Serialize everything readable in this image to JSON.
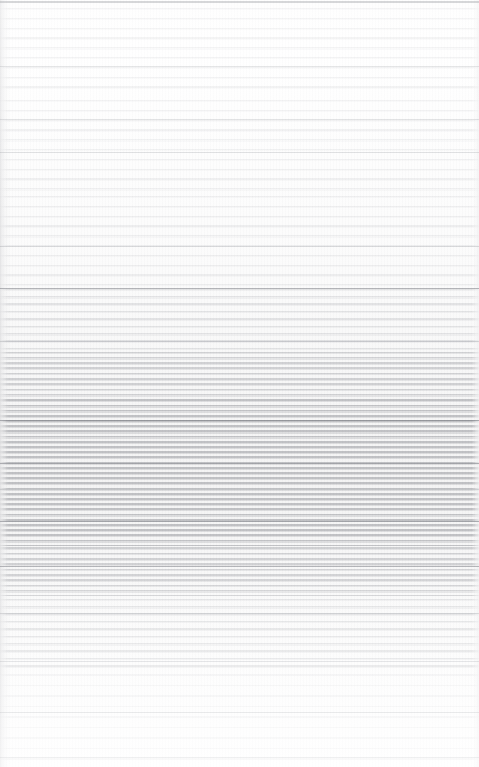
{
  "document": {
    "kind": "scanned-page",
    "legible_text": "",
    "note": "No legible text, headings, icons or UI chrome are resolvable in this scan; the page reads as extremely low-contrast horizontal line texture only.",
    "page_width_px": 479,
    "page_height_px": 767,
    "paper_color": "#fdfdfd",
    "ink_color": "#70727a"
  },
  "structure": {
    "top_rule": {
      "label": "top-edge-rule",
      "y": 1,
      "height": 2,
      "color": "#787a80"
    },
    "bands": [
      {
        "label": "upper-sparse-text",
        "density": "sparse",
        "top": 4,
        "height": 92,
        "line_pitch_px": 9.8
      },
      {
        "label": "upper-mid-sparse-text",
        "density": "sparse",
        "top": 96,
        "height": 96,
        "line_pitch_px": 9.8
      },
      {
        "label": "mid-upper-text",
        "density": "sparse",
        "top": 192,
        "height": 94,
        "line_pitch_px": 9.8
      },
      {
        "label": "transition-text",
        "density": "medium",
        "top": 286,
        "height": 64,
        "line_pitch_px": 7.4
      },
      {
        "label": "dense-text-upper",
        "density": "dense",
        "top": 350,
        "height": 48,
        "line_pitch_px": 5.3
      },
      {
        "label": "dense-text-core",
        "density": "densest",
        "top": 398,
        "height": 148,
        "line_pitch_px": 5.2
      },
      {
        "label": "dense-text-lower",
        "density": "dense",
        "top": 546,
        "height": 50,
        "line_pitch_px": 5.3
      },
      {
        "label": "lower-medium-text",
        "density": "medium",
        "top": 596,
        "height": 74,
        "line_pitch_px": 7.4
      },
      {
        "label": "foot-faint-text",
        "density": "faint",
        "top": 670,
        "height": 97,
        "line_pitch_px": 10.5
      }
    ],
    "accent_strokes": [
      {
        "label": "rule-upper-a",
        "y": 66,
        "weight": "soft"
      },
      {
        "label": "rule-upper-b",
        "y": 119,
        "weight": "soft"
      },
      {
        "label": "rule-upper-c",
        "y": 152,
        "weight": "soft"
      },
      {
        "label": "rule-mid-a",
        "y": 246,
        "weight": "soft"
      },
      {
        "label": "rule-mid-b",
        "y": 288,
        "weight": "hard"
      },
      {
        "label": "rule-mid-c",
        "y": 341,
        "weight": "soft"
      },
      {
        "label": "rule-core-a",
        "y": 420,
        "weight": "hard"
      },
      {
        "label": "rule-core-b",
        "y": 463,
        "weight": "hard"
      },
      {
        "label": "rule-core-c",
        "y": 489,
        "weight": "soft"
      },
      {
        "label": "rule-core-d",
        "y": 521,
        "weight": "hard"
      },
      {
        "label": "rule-lower-a",
        "y": 566,
        "weight": "hard"
      },
      {
        "label": "rule-lower-b",
        "y": 613,
        "weight": "soft"
      },
      {
        "label": "rule-lower-c",
        "y": 661,
        "weight": "soft"
      },
      {
        "label": "rule-foot-a",
        "y": 712,
        "weight": "soft"
      },
      {
        "label": "rule-foot-b",
        "y": 757,
        "weight": "soft"
      }
    ]
  }
}
